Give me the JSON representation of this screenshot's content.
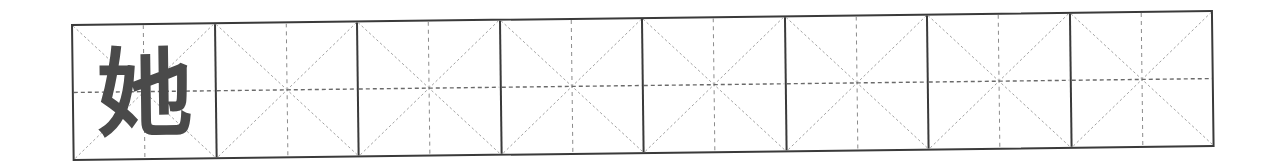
{
  "worksheet": {
    "title": "Tian zi ge writing practice grid",
    "cell_count": 8,
    "colors": {
      "border": "#3a3a3a",
      "guide": "#8a8a8a",
      "character": "#4a4a4a"
    },
    "cells": [
      {
        "character": "她"
      },
      {
        "character": ""
      },
      {
        "character": ""
      },
      {
        "character": ""
      },
      {
        "character": ""
      },
      {
        "character": ""
      },
      {
        "character": ""
      },
      {
        "character": ""
      }
    ]
  }
}
